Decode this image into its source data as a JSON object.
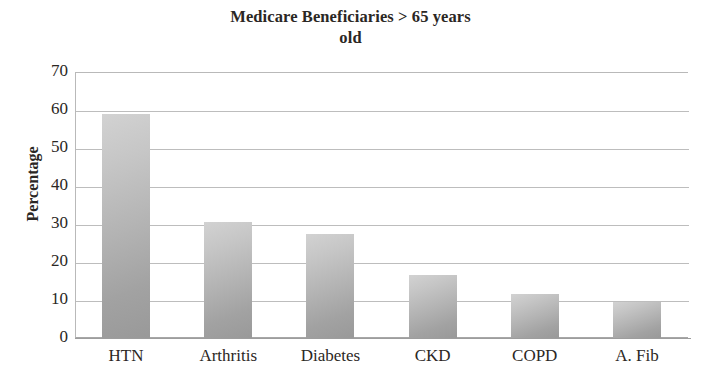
{
  "chart_data": {
    "type": "bar",
    "title": "Medicare Beneficiaries > 65 years old",
    "title_lines": [
      "Medicare Beneficiaries > 65 years",
      "old"
    ],
    "xlabel": "",
    "ylabel": "Percentage",
    "categories": [
      "HTN",
      "Arthritis",
      "Diabetes",
      "CKD",
      "COPD",
      "A. Fib"
    ],
    "values": [
      59,
      30.5,
      27.5,
      16.5,
      11.5,
      9.5
    ],
    "ylim": [
      0,
      70
    ],
    "ytick_step": 10,
    "ytick_labels": [
      "70",
      "60",
      "50",
      "40",
      "30",
      "20",
      "10",
      "0"
    ],
    "ytick_values": [
      70,
      60,
      50,
      40,
      30,
      20,
      10,
      0
    ],
    "grid": true,
    "grid_axis": "y",
    "legend": false,
    "legend_position": "none",
    "series": [
      {
        "name": "Percentage",
        "values": [
          59,
          30.5,
          27.5,
          16.5,
          11.5,
          9.5
        ]
      }
    ],
    "colors": {
      "bar_top": "#d2d2d2",
      "bar_bottom": "#999999",
      "gridline": "#bdbdbd",
      "axis": "#9d9d9d",
      "text": "#2b2724",
      "background": "#ffffff"
    }
  }
}
